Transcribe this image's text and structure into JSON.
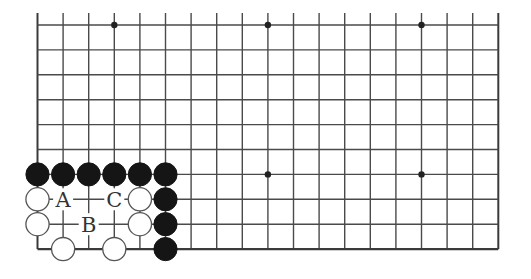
{
  "diagram": {
    "type": "go-board-partial",
    "columns": 19,
    "rows": 10,
    "top_edge_open": true,
    "origin_x": 37.5,
    "origin_y": 25,
    "spacing_x": 25.6,
    "spacing_y": 24.9,
    "line_color": "#4a4a4a",
    "edge_color": "#3a3a3a",
    "star_points": [
      {
        "col": 3,
        "row": 0
      },
      {
        "col": 9,
        "row": 0
      },
      {
        "col": 15,
        "row": 0
      },
      {
        "col": 9,
        "row": 6
      },
      {
        "col": 15,
        "row": 6
      }
    ],
    "stones": [
      {
        "color": "black",
        "col": 0,
        "row": 6
      },
      {
        "color": "black",
        "col": 1,
        "row": 6
      },
      {
        "color": "black",
        "col": 2,
        "row": 6
      },
      {
        "color": "black",
        "col": 3,
        "row": 6
      },
      {
        "color": "black",
        "col": 4,
        "row": 6
      },
      {
        "color": "black",
        "col": 5,
        "row": 6
      },
      {
        "color": "white",
        "col": 0,
        "row": 7
      },
      {
        "color": "white",
        "col": 4,
        "row": 7
      },
      {
        "color": "black",
        "col": 5,
        "row": 7
      },
      {
        "color": "white",
        "col": 0,
        "row": 8
      },
      {
        "color": "white",
        "col": 4,
        "row": 8
      },
      {
        "color": "black",
        "col": 5,
        "row": 8
      },
      {
        "color": "white",
        "col": 1,
        "row": 9
      },
      {
        "color": "white",
        "col": 3,
        "row": 9
      },
      {
        "color": "black",
        "col": 5,
        "row": 9
      }
    ],
    "labels": [
      {
        "text": "A",
        "col": 1,
        "row": 7
      },
      {
        "text": "C",
        "col": 3,
        "row": 7
      },
      {
        "text": "B",
        "col": 2,
        "row": 8
      }
    ]
  }
}
